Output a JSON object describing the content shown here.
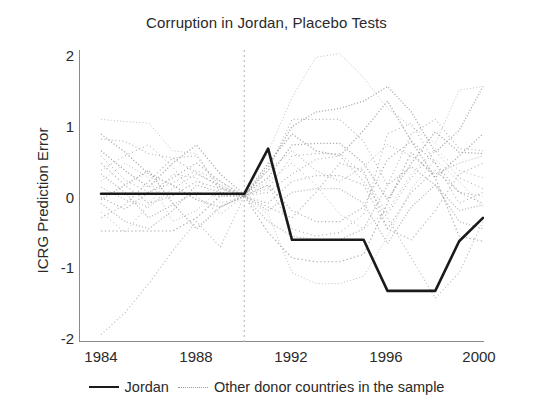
{
  "chart_data": {
    "type": "line",
    "title": "Corruption in Jordan, Placebo Tests",
    "xlabel": "",
    "ylabel": "ICRG Prediction Error",
    "xlim": [
      1984,
      2000
    ],
    "ylim": [
      -2,
      2
    ],
    "x_ticks": [
      "1984",
      "1988",
      "1992",
      "1996",
      "2000"
    ],
    "y_ticks": [
      "2",
      "1",
      "0",
      "-1",
      "-2"
    ],
    "grid": false,
    "legend_position": "bottom-center",
    "annotations": [
      {
        "type": "vline",
        "x": 1990,
        "style": "dashed",
        "color": "#b9b9b9"
      }
    ],
    "x": [
      1984,
      1985,
      1986,
      1987,
      1988,
      1989,
      1990,
      1991,
      1992,
      1993,
      1994,
      1995,
      1996,
      1997,
      1998,
      1999,
      2000
    ],
    "series": [
      {
        "name": "Jordan",
        "style": "solid",
        "color": "#1a1a1a",
        "values": [
          0.03,
          0.03,
          0.03,
          0.03,
          0.03,
          0.03,
          0.03,
          0.65,
          -0.6,
          -0.6,
          -0.6,
          -0.6,
          -1.3,
          -1.3,
          -1.3,
          -0.62,
          -0.3
        ]
      },
      {
        "name": "Other donor countries in the sample",
        "style": "dotted",
        "color": "#9a9a9a",
        "placebo_lines": [
          [
            1.05,
            1.02,
            1.0,
            0.62,
            0.58,
            0.05,
            0.0,
            0.6,
            1.35,
            1.9,
            1.95,
            1.62,
            1.2,
            0.95,
            0.72,
            1.45,
            1.5
          ],
          [
            0.78,
            0.75,
            0.58,
            0.52,
            0.55,
            0.12,
            0.02,
            0.35,
            1.05,
            1.05,
            1.05,
            0.75,
            0.15,
            0.85,
            1.05,
            0.65,
            0.62
          ],
          [
            0.62,
            0.35,
            0.12,
            0.45,
            0.7,
            0.3,
            0.02,
            0.25,
            0.7,
            0.72,
            0.72,
            0.45,
            -0.05,
            0.45,
            0.88,
            0.6,
            0.58
          ],
          [
            0.55,
            0.22,
            0.05,
            0.18,
            0.35,
            0.2,
            0.0,
            0.1,
            0.55,
            0.58,
            0.58,
            0.3,
            -0.25,
            0.25,
            0.62,
            0.25,
            0.1
          ],
          [
            0.45,
            0.15,
            -0.1,
            0.0,
            0.2,
            0.1,
            0.0,
            -0.1,
            0.2,
            0.28,
            0.28,
            0.15,
            -0.45,
            0.05,
            0.35,
            0.05,
            0.0
          ],
          [
            0.3,
            0.05,
            -0.3,
            -0.12,
            0.05,
            0.0,
            0.0,
            -0.2,
            0.05,
            0.1,
            0.1,
            -0.1,
            -0.65,
            -0.15,
            0.15,
            -0.2,
            -0.12
          ],
          [
            0.12,
            -0.05,
            -0.15,
            0.1,
            0.3,
            0.15,
            0.0,
            0.35,
            0.62,
            0.35,
            0.2,
            0.4,
            0.7,
            0.55,
            0.3,
            0.45,
            0.55
          ],
          [
            -0.02,
            -0.18,
            0.05,
            0.25,
            0.45,
            0.2,
            0.0,
            0.15,
            -0.2,
            -0.35,
            -0.35,
            -0.15,
            0.5,
            0.75,
            0.45,
            0.05,
            -0.1
          ],
          [
            -0.1,
            -0.35,
            -0.45,
            -0.2,
            0.15,
            0.05,
            0.0,
            -0.35,
            -0.55,
            -0.6,
            -0.6,
            -0.45,
            0.15,
            0.4,
            0.15,
            -0.35,
            -0.45
          ],
          [
            -0.22,
            -0.5,
            -0.12,
            0.3,
            0.25,
            -0.1,
            0.0,
            0.2,
            0.45,
            0.15,
            -0.25,
            -0.45,
            -0.2,
            0.3,
            0.65,
            0.35,
            0.25
          ],
          [
            -0.48,
            -0.48,
            -0.48,
            -0.48,
            -0.3,
            0.0,
            0.0,
            -0.5,
            -0.85,
            -0.9,
            -0.9,
            -0.8,
            -0.1,
            0.6,
            0.25,
            -0.55,
            -0.62
          ],
          [
            -0.05,
            0.15,
            0.35,
            -0.1,
            -0.45,
            -0.15,
            0.0,
            0.4,
            0.95,
            1.15,
            1.2,
            1.3,
            1.5,
            1.15,
            0.6,
            0.9,
            1.5
          ],
          [
            0.2,
            0.45,
            0.25,
            -0.35,
            -0.2,
            0.1,
            0.0,
            -0.25,
            -1.05,
            -1.2,
            -1.2,
            -1.1,
            -0.55,
            0.1,
            0.5,
            0.2,
            -0.15
          ],
          [
            -1.9,
            -1.6,
            -1.2,
            -0.75,
            -0.35,
            -0.7,
            0.0,
            0.05,
            0.3,
            0.5,
            0.55,
            0.2,
            -0.3,
            -0.85,
            -1.4,
            -1.05,
            -0.35
          ],
          [
            0.85,
            0.6,
            0.3,
            0.15,
            -0.05,
            -0.15,
            0.0,
            0.45,
            0.85,
            0.62,
            0.55,
            0.9,
            1.3,
            0.75,
            0.25,
            0.55,
            0.85
          ],
          [
            0.35,
            0.55,
            0.7,
            0.4,
            0.0,
            -0.25,
            0.0,
            0.15,
            -0.45,
            -0.55,
            -0.5,
            -0.25,
            0.85,
            1.0,
            0.45,
            -0.1,
            0.05
          ],
          [
            -0.3,
            -0.12,
            0.2,
            0.52,
            0.32,
            0.12,
            0.0,
            -0.15,
            -0.3,
            0.05,
            0.45,
            0.35,
            -0.45,
            -0.6,
            -0.2,
            0.3,
            0.45
          ]
        ]
      }
    ]
  },
  "legend": {
    "jordan_label": "Jordan",
    "others_label": "Other donor countries in the sample"
  }
}
